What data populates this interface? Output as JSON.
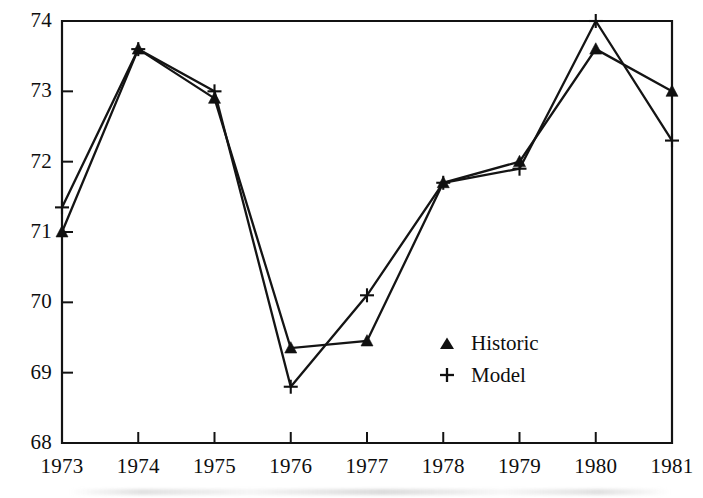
{
  "chart_data": {
    "type": "line",
    "title": "",
    "subtitle": "",
    "xlabel": "",
    "ylabel": "",
    "x": [
      1973,
      1974,
      1975,
      1976,
      1977,
      1978,
      1979,
      1980,
      1981
    ],
    "xtick_labels": [
      "1973",
      "1974",
      "1975",
      "1976",
      "1977",
      "1978",
      "1979",
      "1980",
      "1981"
    ],
    "ytick_labels": [
      "68",
      "69",
      "70",
      "71",
      "72",
      "73",
      "74"
    ],
    "yticks": [
      68,
      69,
      70,
      71,
      72,
      73,
      74
    ],
    "xlim": [
      1973,
      1981
    ],
    "ylim": [
      68,
      74
    ],
    "grid": false,
    "legend_position": "center-right",
    "series": [
      {
        "name": "Historic",
        "marker": "triangle",
        "color": "#101010",
        "values": [
          71.0,
          73.6,
          72.9,
          69.35,
          69.45,
          71.7,
          72.0,
          73.6,
          73.0
        ]
      },
      {
        "name": "Model",
        "marker": "plus",
        "color": "#101010",
        "values": [
          71.35,
          73.6,
          73.0,
          68.8,
          70.1,
          71.7,
          71.9,
          74.0,
          72.3
        ]
      }
    ]
  },
  "legend": {
    "items": [
      {
        "label": "Historic",
        "symbol": "triangle-marker"
      },
      {
        "label": "Model",
        "symbol": "plus-marker"
      }
    ]
  },
  "axes": {
    "y_title": "",
    "x_title": ""
  }
}
